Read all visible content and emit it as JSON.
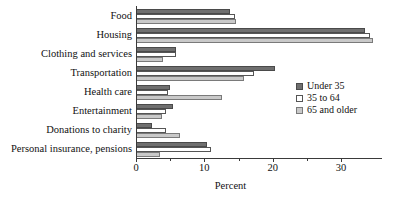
{
  "chart_data": {
    "type": "bar",
    "orientation": "horizontal",
    "title": "",
    "xlabel": "Percent",
    "ylabel": "",
    "xlim": [
      0,
      36
    ],
    "xticks": [
      0,
      10,
      20,
      30
    ],
    "xticks_minor": [
      5,
      15,
      25
    ],
    "grid": false,
    "legend_position": "right",
    "categories": [
      "Food",
      "Housing",
      "Clothing and services",
      "Transportation",
      "Health care",
      "Entertainment",
      "Donations to charity",
      "Personal insurance, pensions"
    ],
    "series": [
      {
        "name": "Under 35",
        "color": "#6f6f6f",
        "values": [
          13.8,
          33.5,
          5.9,
          20.4,
          5.0,
          5.4,
          2.3,
          10.4
        ]
      },
      {
        "name": "35 to 64",
        "color": "#ffffff",
        "values": [
          14.5,
          34.3,
          5.9,
          17.3,
          4.7,
          4.4,
          4.4,
          11.0
        ]
      },
      {
        "name": "65 and older",
        "color": "#c9c9c9",
        "values": [
          14.6,
          34.7,
          4.0,
          15.8,
          12.6,
          3.8,
          6.4,
          3.5
        ]
      }
    ]
  },
  "legend": {
    "items": [
      {
        "label": "Under 35"
      },
      {
        "label": "35 to 64"
      },
      {
        "label": "65 and older"
      }
    ]
  },
  "axis": {
    "x_title": "Percent"
  }
}
